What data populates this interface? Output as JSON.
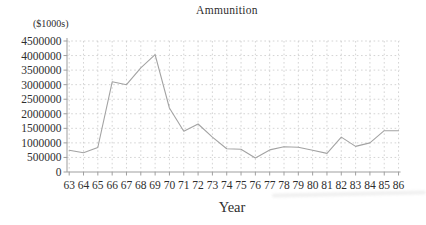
{
  "chart": {
    "title": "Ammunition",
    "y_unit_label": "($1000s)",
    "x_axis_label": "Year"
  },
  "chart_data": {
    "type": "line",
    "title": "Ammunition",
    "xlabel": "Year",
    "ylabel": "($1000s)",
    "categories": [
      "63",
      "64",
      "65",
      "66",
      "67",
      "68",
      "69",
      "70",
      "71",
      "72",
      "73",
      "74",
      "75",
      "76",
      "77",
      "78",
      "79",
      "80",
      "81",
      "82",
      "83",
      "84",
      "85",
      "86"
    ],
    "values": [
      750000,
      660000,
      840000,
      3100000,
      3000000,
      3580000,
      4030000,
      2200000,
      1400000,
      1650000,
      1200000,
      800000,
      780000,
      480000,
      760000,
      870000,
      850000,
      750000,
      640000,
      1200000,
      880000,
      1000000,
      1420000,
      1420000
    ],
    "ylim": [
      0,
      4500000
    ],
    "ytick_step": 500000,
    "ytick_labels": [
      "0",
      "500000",
      "1000000",
      "1500000",
      "2000000",
      "2500000",
      "3000000",
      "3500000",
      "4000000",
      "4500000"
    ],
    "grid": true,
    "legend": false,
    "colors": {
      "series_line": "#a3a3a3",
      "gridline": "#c9c9c9",
      "axis": "#9f9f9f",
      "text": "#2e2e2e",
      "background": "#ffffff"
    }
  }
}
